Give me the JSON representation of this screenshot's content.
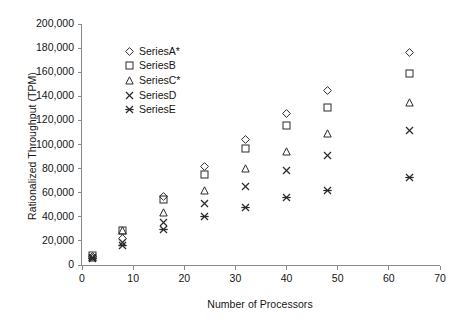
{
  "chart_data": {
    "type": "scatter",
    "title": "",
    "xlabel": "Number of Processors",
    "ylabel": "Rationalized Throughput (TPM)",
    "xlim": [
      0,
      70
    ],
    "ylim": [
      0,
      200000
    ],
    "xticks": [
      0,
      10,
      20,
      30,
      40,
      50,
      60,
      70
    ],
    "yticks": [
      0,
      20000,
      40000,
      60000,
      80000,
      100000,
      120000,
      140000,
      160000,
      180000,
      200000
    ],
    "xtick_labels": [
      "0",
      "10",
      "20",
      "30",
      "40",
      "50",
      "60",
      "70"
    ],
    "ytick_labels": [
      "0",
      "20,000",
      "40,000",
      "60,000",
      "80,000",
      "100,000",
      "120,000",
      "140,000",
      "160,000",
      "180,000",
      "200,000"
    ],
    "grid": false,
    "legend_position": "upper-left-inside",
    "x": [
      2,
      8,
      16,
      24,
      32,
      40,
      48,
      64
    ],
    "series": [
      {
        "name": "SeriesA*",
        "marker": "diamond",
        "values": [
          7000,
          22000,
          57000,
          82000,
          104500,
          125500,
          144500,
          176000
        ]
      },
      {
        "name": "SeriesB",
        "marker": "square",
        "values": [
          7500,
          28500,
          54500,
          75500,
          97000,
          116000,
          131000,
          159000
        ]
      },
      {
        "name": "SeriesC*",
        "marker": "triangle",
        "values": [
          6500,
          29000,
          43500,
          62000,
          80000,
          94000,
          109000,
          135000
        ]
      },
      {
        "name": "SeriesD",
        "marker": "cross",
        "values": [
          6000,
          18500,
          35500,
          51000,
          65000,
          78500,
          90500,
          112000
        ]
      },
      {
        "name": "SeriesE",
        "marker": "asterisk",
        "values": [
          5500,
          16500,
          29500,
          40000,
          48000,
          56000,
          62000,
          72500
        ]
      }
    ]
  },
  "legend": {
    "items": [
      {
        "label": "SeriesA*",
        "marker": "diamond"
      },
      {
        "label": "SeriesB",
        "marker": "square"
      },
      {
        "label": "SeriesC*",
        "marker": "triangle"
      },
      {
        "label": "SeriesD",
        "marker": "cross"
      },
      {
        "label": "SeriesE",
        "marker": "asterisk"
      }
    ]
  },
  "colors": {
    "axis": "#8a8a8a",
    "marker": "#2b2b2b",
    "text": "#151515",
    "background": "#ffffff"
  }
}
